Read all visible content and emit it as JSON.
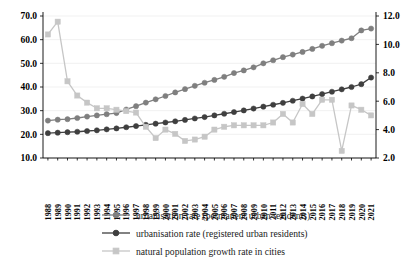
{
  "chart_data": {
    "type": "line",
    "title": "",
    "xlabel": "",
    "ylabel": "",
    "y2label": "",
    "grid": false,
    "legend_position": "bottom",
    "x": [
      1988,
      1989,
      1990,
      1991,
      1992,
      1993,
      1994,
      1995,
      1996,
      1997,
      1998,
      1999,
      2000,
      2001,
      2002,
      2003,
      2004,
      2005,
      2006,
      2007,
      2008,
      2009,
      2010,
      2011,
      2012,
      2013,
      2014,
      2015,
      2016,
      2017,
      2018,
      2019,
      2020,
      2021
    ],
    "ylim": [
      10.0,
      70.0
    ],
    "yticks": [
      "10.0",
      "20.0",
      "30.0",
      "40.0",
      "50.0",
      "60.0",
      "70.0"
    ],
    "y2lim": [
      2.0,
      12.0
    ],
    "y2ticks": [
      "2.0",
      "4.0",
      "6.0",
      "8.0",
      "10.0",
      "12.0"
    ],
    "series": [
      {
        "name": "urbanisation rate (permanent urban residents)",
        "axis": "left",
        "color": "#7f7f7f",
        "marker": "circle",
        "values": [
          25.8,
          26.2,
          26.4,
          26.9,
          27.5,
          28.0,
          28.5,
          29.0,
          30.5,
          31.9,
          33.4,
          34.8,
          36.2,
          37.7,
          39.1,
          40.5,
          41.8,
          43.0,
          44.3,
          45.9,
          47.0,
          48.3,
          50.0,
          51.3,
          52.6,
          53.7,
          54.8,
          56.1,
          57.4,
          58.5,
          59.6,
          60.6,
          63.9,
          64.7
        ]
      },
      {
        "name": "urbanisation rate (registered urban residents)",
        "axis": "left",
        "color": "#3f3f3f",
        "marker": "circle",
        "values": [
          20.5,
          20.7,
          20.9,
          21.1,
          21.4,
          21.7,
          22.1,
          22.5,
          23.0,
          23.5,
          24.0,
          24.5,
          25.0,
          25.5,
          26.1,
          26.7,
          27.3,
          28.0,
          28.7,
          29.4,
          30.1,
          30.9,
          31.7,
          32.5,
          33.3,
          34.2,
          35.1,
          36.0,
          37.0,
          38.0,
          39.0,
          40.0,
          41.2,
          44.0
        ]
      },
      {
        "name": "natural population growth rate in cities",
        "axis": "right",
        "color": "#c6c6c6",
        "marker": "square",
        "values": [
          10.7,
          11.6,
          7.4,
          6.4,
          5.9,
          5.5,
          5.5,
          5.4,
          5.3,
          5.2,
          4.2,
          3.4,
          4.0,
          3.7,
          3.2,
          3.3,
          3.5,
          4.0,
          4.2,
          4.3,
          4.3,
          4.3,
          4.3,
          4.5,
          5.1,
          4.5,
          5.8,
          5.1,
          6.1,
          6.1,
          2.5,
          5.7,
          5.4,
          5.0
        ]
      }
    ],
    "legend": [
      {
        "label": "urbanisation rate (permanent urban residents)",
        "color": "#7f7f7f",
        "marker": "circle"
      },
      {
        "label": "urbanisation rate (registered urban residents)",
        "color": "#3f3f3f",
        "marker": "circle"
      },
      {
        "label": "natural population growth rate in cities",
        "color": "#c6c6c6",
        "marker": "square"
      }
    ]
  }
}
